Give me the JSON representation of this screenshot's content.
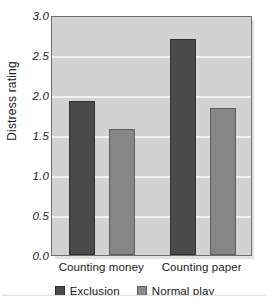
{
  "figure": {
    "title_remnant": "",
    "background_color": "#ffffff",
    "plot_background_color": "#d2d2d2",
    "plot_border_color": "#6e6e6e",
    "gridline_color": "#f3f3f3"
  },
  "chart_data": {
    "type": "bar",
    "title": "",
    "xlabel": "",
    "ylabel": "Distress rating",
    "categories": [
      "Counting money",
      "Counting paper"
    ],
    "series": [
      {
        "name": "Exclusion",
        "color": "#4a4a4a",
        "values": [
          1.92,
          2.7
        ]
      },
      {
        "name": "Normal play",
        "color": "#868686",
        "values": [
          1.57,
          1.84
        ]
      }
    ],
    "ylim": [
      0.0,
      3.0
    ],
    "yticks": [
      "0.0",
      "0.5",
      "1.0",
      "1.5",
      "2.0",
      "2.5",
      "3.0"
    ],
    "ytick_values": [
      0.0,
      0.5,
      1.0,
      1.5,
      2.0,
      2.5,
      3.0
    ],
    "grid": true,
    "grid_axis": "y",
    "legend_position": "bottom-center"
  },
  "legend": {
    "entries": [
      {
        "label": "Exclusion",
        "color": "#4a4a4a"
      },
      {
        "label": "Normal play",
        "color": "#868686"
      }
    ]
  }
}
